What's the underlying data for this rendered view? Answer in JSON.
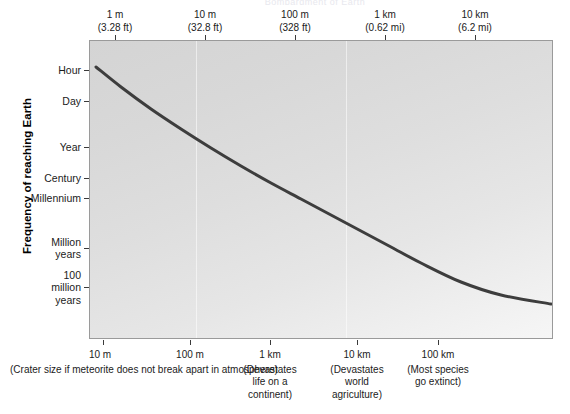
{
  "ghost_title": "Bombardment of Earth",
  "chart_data": {
    "type": "line",
    "xlabel": "",
    "ylabel": "Frequency of reaching Earth",
    "grid": "faint vertical only",
    "legend": "none",
    "top_axis": {
      "name": "Diameter of impactor",
      "ticks": [
        {
          "label": "1 m",
          "sub": "(3.28 ft)",
          "x_px": 115
        },
        {
          "label": "10 m",
          "sub": "(32.8 ft)",
          "x_px": 205
        },
        {
          "label": "100 m",
          "sub": "(328 ft)",
          "x_px": 295
        },
        {
          "label": "1 km",
          "sub": "(0.62 mi)",
          "x_px": 385
        },
        {
          "label": "10 km",
          "sub": "(6.2 mi)",
          "x_px": 475
        }
      ]
    },
    "bottom_axis": {
      "name": "Crater size",
      "ticks": [
        {
          "label": "10 m",
          "note": "(Crater size if meteorite does not break\napart in atmosphere)",
          "x_px": 103,
          "wide": true
        },
        {
          "label": "100 m",
          "note": "",
          "x_px": 190
        },
        {
          "label": "1 km",
          "note": "(Devastates\nlife on a\ncontinent)",
          "x_px": 270
        },
        {
          "label": "10 km",
          "note": "(Devastates\nworld\nagriculture)",
          "x_px": 357
        },
        {
          "label": "100 km",
          "note": "(Most species\ngo extinct)",
          "x_px": 438
        }
      ]
    },
    "y_axis": {
      "ticks": [
        {
          "label": "Hour",
          "y_px": 70
        },
        {
          "label": "Day",
          "y_px": 101
        },
        {
          "label": "Year",
          "y_px": 147
        },
        {
          "label": "Century",
          "y_px": 178
        },
        {
          "label": "Millennium",
          "y_px": 198
        },
        {
          "label": "Million\nyears",
          "y_px": 248
        },
        {
          "label": "100\nmillion\nyears",
          "y_px": 287
        }
      ]
    },
    "curve": {
      "name": "impact frequency",
      "color": "#3d3d3d",
      "width_px": 3,
      "points_px": [
        [
          95,
          66
        ],
        [
          120,
          86
        ],
        [
          150,
          108
        ],
        [
          180,
          128
        ],
        [
          210,
          147
        ],
        [
          240,
          165
        ],
        [
          270,
          182
        ],
        [
          300,
          198
        ],
        [
          330,
          214
        ],
        [
          360,
          230
        ],
        [
          390,
          246
        ],
        [
          420,
          262
        ],
        [
          460,
          281
        ],
        [
          500,
          294
        ],
        [
          550,
          303
        ]
      ],
      "description": "Monotonically decreasing frequency: meter-scale impactors arrive hourly, 10 km impactors roughly once per 100 million years."
    },
    "vgrid_x_px": [
      195,
      345
    ],
    "plot_rect_px": {
      "left": 89,
      "top": 40,
      "width": 464,
      "height": 299
    },
    "data_points": [
      {
        "impactor_diameter": "1 m",
        "crater": "10 m",
        "frequency": "Hour"
      },
      {
        "impactor_diameter": "10 m",
        "crater": "100 m",
        "frequency": "Year"
      },
      {
        "impactor_diameter": "100 m",
        "crater": "1 km",
        "frequency": "Millennium"
      },
      {
        "impactor_diameter": "1 km",
        "crater": "10 km",
        "frequency": "Million years"
      },
      {
        "impactor_diameter": "10 km",
        "crater": "100 km",
        "frequency": "100 million years"
      }
    ]
  }
}
